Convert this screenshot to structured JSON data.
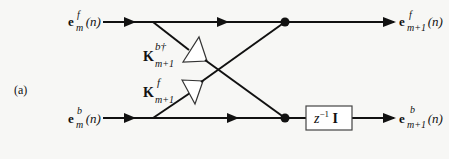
{
  "diagram": {
    "panel_label": "(a)",
    "inputs": {
      "forward": {
        "base": "e",
        "sup": "f",
        "sub": "m",
        "arg": "(n)"
      },
      "backward": {
        "base": "e",
        "sup": "b",
        "sub": "m",
        "arg": "(n)"
      }
    },
    "outputs": {
      "forward": {
        "base": "e",
        "sup": "f",
        "sub": "m+1",
        "arg": "(n)"
      },
      "backward": {
        "base": "e",
        "sup": "b",
        "sub": "m+1",
        "arg": "(n)"
      }
    },
    "gains": {
      "upper": {
        "base": "K",
        "sup": "b†",
        "sub": "m+1"
      },
      "lower": {
        "base": "K",
        "sup": "f",
        "sub": "m+1"
      }
    },
    "delay_block": {
      "base": "z",
      "exp": "−1",
      "matrix": "I"
    },
    "colors": {
      "line": "#111111",
      "background": "#f7f7f5"
    }
  }
}
